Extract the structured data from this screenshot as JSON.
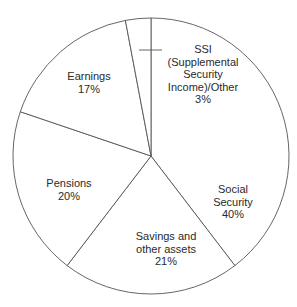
{
  "chart_data": {
    "type": "pie",
    "title": "",
    "start_angle_deg": 0,
    "direction": "clockwise",
    "slices": [
      {
        "label": "Social Security",
        "value": 40,
        "display": [
          "Social",
          "Security",
          "40%"
        ]
      },
      {
        "label": "Savings and other assets",
        "value": 21,
        "display": [
          "Savings and",
          "other assets",
          "21%"
        ]
      },
      {
        "label": "Pensions",
        "value": 20,
        "display": [
          "Pensions",
          "20%"
        ]
      },
      {
        "label": "Earnings",
        "value": 17,
        "display": [
          "Earnings",
          "17%"
        ]
      },
      {
        "label": "SSI (Supplemental Security Income)/Other",
        "value": 3,
        "display": [
          "SSI",
          "(Supplemental",
          "Security",
          "Income)/Other",
          "3%"
        ]
      }
    ],
    "colors": {
      "fill": "#ffffff",
      "stroke": "#555555",
      "text": "#2a2a2a"
    },
    "legend": "none"
  }
}
